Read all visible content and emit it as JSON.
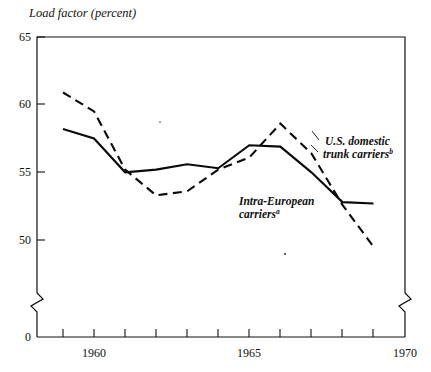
{
  "figure": {
    "y_axis_title": "Load factor (percent)",
    "y_tick_labels": [
      "65",
      "60",
      "55",
      "50",
      "0"
    ],
    "x_tick_labels": [
      "1960",
      "1965",
      "1970"
    ],
    "label_us_line1": "U.S. domestic",
    "label_us_line2": "trunk carriers",
    "label_us_sup": "b",
    "label_eu_line1": "Intra-European",
    "label_eu_line2": "carriers",
    "label_eu_sup": "a",
    "ink_color": "#0a0a0a",
    "background_color": "#ffffff"
  },
  "chart_data": {
    "type": "line",
    "title": "",
    "xlabel": "",
    "ylabel": "Load factor (percent)",
    "xlim": [
      1958.5,
      1970
    ],
    "ylim": [
      49,
      65
    ],
    "grid": false,
    "legend": "inline annotations",
    "y_ticks": [
      50,
      55,
      60,
      65
    ],
    "y_axis_break": true,
    "y_axis_zero_shown": 0,
    "x_ticks": [
      1959,
      1960,
      1961,
      1962,
      1963,
      1964,
      1965,
      1966,
      1967,
      1968,
      1969,
      1970
    ],
    "x_tick_labeled": [
      1960,
      1965,
      1970
    ],
    "x": [
      1959,
      1960,
      1961,
      1962,
      1963,
      1964,
      1965,
      1966,
      1967,
      1968,
      1969
    ],
    "series": [
      {
        "name": "Intra-European carriers",
        "style": "solid",
        "footnote": "a",
        "x": [
          1959,
          1960,
          1961,
          1962,
          1963,
          1964,
          1965,
          1966,
          1967,
          1968,
          1969
        ],
        "values": [
          58.2,
          57.5,
          55.0,
          55.2,
          55.6,
          55.3,
          57.0,
          56.9,
          55.0,
          52.8,
          52.7
        ]
      },
      {
        "name": "U.S. domestic trunk carriers",
        "style": "dashed",
        "footnote": "b",
        "x": [
          1959,
          1960,
          1961,
          1962,
          1963,
          1964,
          1965,
          1966,
          1967,
          1968,
          1969
        ],
        "values": [
          60.9,
          59.5,
          55.2,
          53.3,
          53.6,
          55.2,
          56.1,
          58.6,
          56.4,
          52.6,
          49.5
        ]
      }
    ]
  }
}
